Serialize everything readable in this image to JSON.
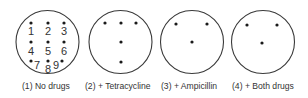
{
  "figure": {
    "panels": [
      {
        "id": 1,
        "caption": "(1)  No drugs",
        "cx": 47.5,
        "cy": 42,
        "r": 31.5,
        "colonies": [
          [
            31,
            23
          ],
          [
            48,
            23
          ],
          [
            64,
            23
          ],
          [
            31,
            42
          ],
          [
            48,
            42
          ],
          [
            64,
            42
          ],
          [
            31,
            61
          ],
          [
            48,
            61
          ],
          [
            62,
            61
          ]
        ],
        "numbers": [
          {
            "t": "1",
            "x": 28,
            "y": 35
          },
          {
            "t": "2",
            "x": 45,
            "y": 35
          },
          {
            "t": "3",
            "x": 61,
            "y": 35
          },
          {
            "t": "4",
            "x": 28,
            "y": 55
          },
          {
            "t": "5",
            "x": 45,
            "y": 55
          },
          {
            "t": "6",
            "x": 61,
            "y": 55
          },
          {
            "t": "7",
            "x": 34,
            "y": 69
          },
          {
            "t": "8",
            "x": 45,
            "y": 73
          },
          {
            "t": "9",
            "x": 53,
            "y": 69
          }
        ]
      },
      {
        "id": 2,
        "caption": "(2)  + Tetracycline",
        "cx": 120.5,
        "cy": 42,
        "r": 31.5,
        "colonies": [
          [
            105,
            23
          ],
          [
            121,
            23
          ],
          [
            136,
            23
          ],
          [
            121,
            42
          ],
          [
            121,
            62
          ]
        ]
      },
      {
        "id": 3,
        "caption": "(3)  + Ampicillin",
        "cx": 192,
        "cy": 42,
        "r": 31.5,
        "colonies": [
          [
            176,
            24
          ],
          [
            207,
            24
          ],
          [
            192,
            42
          ]
        ]
      },
      {
        "id": 4,
        "caption": "(4)  + Both drugs",
        "cx": 263,
        "cy": 42,
        "r": 31.5,
        "colonies": [
          [
            247,
            25
          ],
          [
            277,
            25
          ],
          [
            262,
            43
          ]
        ]
      }
    ]
  }
}
